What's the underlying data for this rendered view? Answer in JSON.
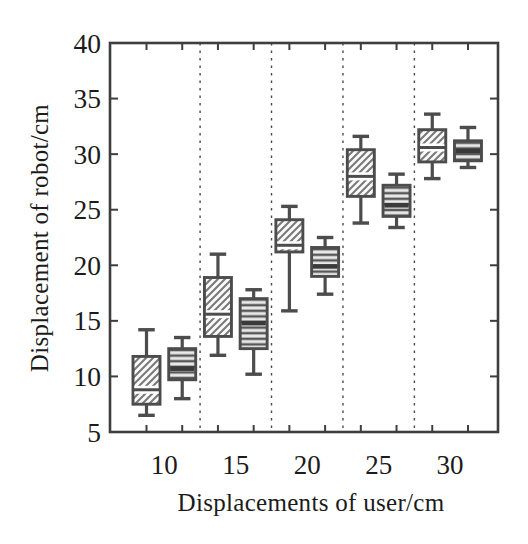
{
  "figure": {
    "background": "#ffffff"
  },
  "chart_data": {
    "type": "boxplot",
    "title": "",
    "xlabel": "Displacements of user/cm",
    "ylabel": "Displacement of robot/cm",
    "ylim": [
      5,
      40
    ],
    "yticks": [
      5,
      10,
      15,
      20,
      25,
      30,
      35,
      40
    ],
    "categories": [
      "10",
      "15",
      "20",
      "25",
      "30"
    ],
    "grid": false,
    "legend": "none",
    "group_separators": "dashed-vertical",
    "series": [
      {
        "name": "diagonal-hatch-boxes",
        "hatch": "diagonal",
        "boxes": [
          {
            "category": "10",
            "low": 6.5,
            "q1": 7.5,
            "median": 8.8,
            "q3": 11.8,
            "high": 14.2
          },
          {
            "category": "15",
            "low": 11.9,
            "q1": 13.6,
            "median": 15.6,
            "q3": 18.9,
            "high": 21.0
          },
          {
            "category": "20",
            "low": 15.9,
            "q1": 21.2,
            "median": 21.8,
            "q3": 24.1,
            "high": 25.3
          },
          {
            "category": "25",
            "low": 23.8,
            "q1": 26.2,
            "median": 28.0,
            "q3": 30.4,
            "high": 31.6
          },
          {
            "category": "30",
            "low": 27.8,
            "q1": 29.3,
            "median": 30.6,
            "q3": 32.2,
            "high": 33.6
          }
        ]
      },
      {
        "name": "horizontal-hatch-boxes",
        "hatch": "horizontal",
        "boxes": [
          {
            "category": "10",
            "low": 8.0,
            "q1": 9.7,
            "median": 10.7,
            "q3": 12.5,
            "high": 13.5
          },
          {
            "category": "15",
            "low": 10.2,
            "q1": 12.5,
            "median": 14.8,
            "q3": 17.0,
            "high": 17.8
          },
          {
            "category": "20",
            "low": 17.4,
            "q1": 19.0,
            "median": 19.9,
            "q3": 21.6,
            "high": 22.5
          },
          {
            "category": "25",
            "low": 23.4,
            "q1": 24.4,
            "median": 25.4,
            "q3": 27.2,
            "high": 28.2
          },
          {
            "category": "30",
            "low": 28.8,
            "q1": 29.4,
            "median": 30.3,
            "q3": 31.2,
            "high": 32.4
          }
        ]
      }
    ],
    "colors": {
      "frame": "#3e3e3e",
      "box_border": "#4c4c4c",
      "whisker": "#4c4c4c",
      "hatch_diagonal_line": "#7a7a7a",
      "hatch_diagonal_bg": "#fbfbfb",
      "hatch_horizontal_line": "#585858",
      "hatch_horizontal_bg": "#e9e9e9",
      "median_band": "#3a3a3a",
      "separator": "#4a4a4a",
      "text": "#1b1b1b",
      "background": "#ffffff"
    }
  }
}
